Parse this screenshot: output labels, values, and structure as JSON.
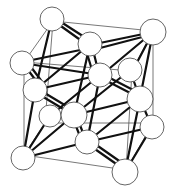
{
  "diagram": {
    "type": "crystal-unit-cell",
    "width": 177,
    "height": 190,
    "colors": {
      "background": "#ffffff",
      "edge": "#555555",
      "bond": "#111111",
      "atom_fill": "#ffffff",
      "atom_stroke": "#555555"
    },
    "cube_vertices": {
      "back_tl": [
        53,
        21
      ],
      "back_tr": [
        153,
        31
      ],
      "back_bl": [
        45,
        123
      ],
      "back_br": [
        153,
        123
      ],
      "front_tl": [
        24,
        62
      ],
      "front_tr": [
        132,
        71
      ],
      "front_bl": [
        24,
        155
      ],
      "front_br": [
        126,
        170
      ]
    },
    "cube_edges": [
      [
        "back_tl",
        "back_tr"
      ],
      [
        "back_tr",
        "back_br"
      ],
      [
        "back_br",
        "back_bl"
      ],
      [
        "back_bl",
        "back_tl"
      ],
      [
        "front_tl",
        "front_tr"
      ],
      [
        "front_tr",
        "front_br"
      ],
      [
        "front_br",
        "front_bl"
      ],
      [
        "front_bl",
        "front_tl"
      ],
      [
        "back_tl",
        "front_tl"
      ],
      [
        "back_tr",
        "front_tr"
      ],
      [
        "back_bl",
        "front_bl"
      ],
      [
        "back_br",
        "front_br"
      ]
    ],
    "atoms": [
      {
        "id": "a1",
        "x": 52,
        "y": 19,
        "r": 12
      },
      {
        "id": "a2",
        "x": 153,
        "y": 32,
        "r": 13
      },
      {
        "id": "a3",
        "x": 22,
        "y": 63,
        "r": 12
      },
      {
        "id": "a4",
        "x": 130,
        "y": 70,
        "r": 12
      },
      {
        "id": "a5",
        "x": 35,
        "y": 90,
        "r": 12
      },
      {
        "id": "a6",
        "x": 50,
        "y": 116,
        "r": 11
      },
      {
        "id": "a7",
        "x": 152,
        "y": 127,
        "r": 12
      },
      {
        "id": "a8",
        "x": 23,
        "y": 158,
        "r": 12
      },
      {
        "id": "a9",
        "x": 125,
        "y": 172,
        "r": 13
      },
      {
        "id": "a10",
        "x": 100,
        "y": 75,
        "r": 12
      },
      {
        "id": "a11",
        "x": 90,
        "y": 44,
        "r": 12
      },
      {
        "id": "a12",
        "x": 140,
        "y": 99,
        "r": 13
      },
      {
        "id": "a13",
        "x": 87,
        "y": 142,
        "r": 12
      },
      {
        "id": "a14",
        "x": 74,
        "y": 115,
        "r": 13
      }
    ],
    "bonds": [
      [
        [
          58,
          24
        ],
        [
          86,
          44
        ]
      ],
      [
        [
          61,
          22
        ],
        [
          89,
          40
        ]
      ],
      [
        [
          32,
          60
        ],
        [
          90,
          48
        ]
      ],
      [
        [
          95,
          44
        ],
        [
          153,
          32
        ]
      ],
      [
        [
          100,
          48
        ],
        [
          150,
          35
        ]
      ],
      [
        [
          153,
          32
        ],
        [
          133,
          70
        ]
      ],
      [
        [
          153,
          32
        ],
        [
          140,
          98
        ]
      ],
      [
        [
          153,
          32
        ],
        [
          104,
          73
        ]
      ],
      [
        [
          28,
          70
        ],
        [
          40,
          86
        ]
      ],
      [
        [
          31,
          67
        ],
        [
          43,
          83
        ]
      ],
      [
        [
          40,
          95
        ],
        [
          70,
          113
        ]
      ],
      [
        [
          43,
          92
        ],
        [
          73,
          110
        ]
      ],
      [
        [
          93,
          50
        ],
        [
          98,
          70
        ]
      ],
      [
        [
          86,
          50
        ],
        [
          92,
          70
        ]
      ],
      [
        [
          105,
          80
        ],
        [
          136,
          96
        ]
      ],
      [
        [
          108,
          77
        ],
        [
          139,
          93
        ]
      ],
      [
        [
          78,
          120
        ],
        [
          85,
          138
        ]
      ],
      [
        [
          74,
          121
        ],
        [
          81,
          139
        ]
      ],
      [
        [
          92,
          147
        ],
        [
          122,
          168
        ]
      ],
      [
        [
          95,
          144
        ],
        [
          125,
          165
        ]
      ],
      [
        [
          23,
          158
        ],
        [
          74,
          115
        ]
      ],
      [
        [
          23,
          158
        ],
        [
          87,
          142
        ]
      ],
      [
        [
          23,
          158
        ],
        [
          35,
          90
        ]
      ],
      [
        [
          23,
          158
        ],
        [
          50,
          116
        ]
      ],
      [
        [
          22,
          63
        ],
        [
          100,
          75
        ]
      ],
      [
        [
          35,
          90
        ],
        [
          90,
          44
        ]
      ],
      [
        [
          52,
          19
        ],
        [
          35,
          90
        ]
      ],
      [
        [
          50,
          116
        ],
        [
          100,
          75
        ]
      ],
      [
        [
          74,
          115
        ],
        [
          130,
          70
        ]
      ],
      [
        [
          74,
          115
        ],
        [
          140,
          99
        ]
      ],
      [
        [
          74,
          115
        ],
        [
          90,
          44
        ]
      ],
      [
        [
          87,
          142
        ],
        [
          140,
          99
        ]
      ],
      [
        [
          87,
          142
        ],
        [
          152,
          127
        ]
      ],
      [
        [
          125,
          172
        ],
        [
          140,
          99
        ]
      ],
      [
        [
          125,
          172
        ],
        [
          152,
          127
        ]
      ],
      [
        [
          87,
          142
        ],
        [
          100,
          75
        ]
      ],
      [
        [
          35,
          90
        ],
        [
          100,
          75
        ]
      ],
      [
        [
          130,
          70
        ],
        [
          140,
          99
        ]
      ],
      [
        [
          152,
          127
        ],
        [
          140,
          99
        ]
      ]
    ]
  }
}
